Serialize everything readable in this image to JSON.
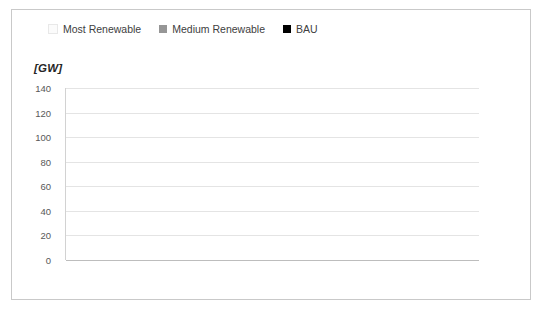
{
  "chart_data": {
    "type": "bar",
    "title": "",
    "xlabel": "",
    "ylabel": "[GW]",
    "ylim": [
      0,
      140
    ],
    "ytick_step": 20,
    "yticks": [
      "140",
      "120",
      "100",
      "80",
      "60",
      "40",
      "20",
      "0"
    ],
    "grid": true,
    "legend_position": "top",
    "categories": [
      "Other renewable sources Photovoltaic Solar Energy (Installed power)",
      "Hydraulic energy (Installed power)",
      "Electrical system safety (Imported power)"
    ],
    "category_lines": [
      [
        "Other renewable sources",
        "Photovoltaic Solar Energy",
        "(Installed power)"
      ],
      [
        "Hydraulic energy",
        "(Installed power)"
      ],
      [
        "Electrical system safety",
        "(Imported power)"
      ]
    ],
    "series": [
      {
        "name": "Most Renewable",
        "color": "#fbfbfb",
        "values": [
          124,
          116,
          16.7
        ],
        "labels": [
          "124",
          "116",
          "16.7"
        ]
      },
      {
        "name": "Medium Renewable",
        "color": "#969696",
        "values": [
          44,
          116,
          5.7
        ],
        "labels": [
          "44",
          "116",
          "5.7"
        ]
      },
      {
        "name": "BAU",
        "color": "#000000",
        "values": [
          0.13,
          105,
          3
        ],
        "labels": [
          "0.13",
          "105",
          "3"
        ]
      }
    ]
  },
  "legend": {
    "items": [
      {
        "label": "Most Renewable",
        "color": "#fbfbfb"
      },
      {
        "label": "Medium Renewable",
        "color": "#969696"
      },
      {
        "label": "BAU",
        "color": "#000000"
      }
    ]
  },
  "axis": {
    "unit_label": "[GW]"
  }
}
